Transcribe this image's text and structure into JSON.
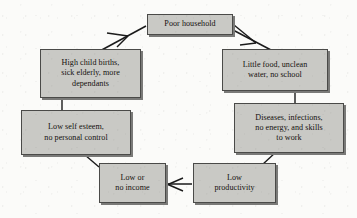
{
  "diagram": {
    "type": "cycle-flowchart",
    "colors": {
      "node_fill": "#c9c9c5",
      "node_border": "#4a4a48",
      "node_shadow": "#7a7a78",
      "background": "#fbfbf9",
      "text": "#14100e",
      "connector": "#1a1a1a"
    },
    "nodes": [
      {
        "id": "poor-household",
        "lines": [
          "Poor household"
        ],
        "x": 147,
        "y": 14,
        "w": 86,
        "h": 21
      },
      {
        "id": "little-food",
        "lines": [
          "Little food, unclean",
          "water, no school"
        ],
        "x": 222,
        "y": 49,
        "w": 106,
        "h": 42
      },
      {
        "id": "diseases",
        "lines": [
          "Diseases, infections,",
          "no energy, and skills",
          "to work"
        ],
        "x": 234,
        "y": 103,
        "w": 110,
        "h": 50
      },
      {
        "id": "low-productivity",
        "lines": [
          "Low",
          "productivity"
        ],
        "x": 193,
        "y": 163,
        "w": 83,
        "h": 40
      },
      {
        "id": "low-income",
        "lines": [
          "Low or",
          "no income"
        ],
        "x": 99,
        "y": 163,
        "w": 67,
        "h": 40
      },
      {
        "id": "low-self-esteem",
        "lines": [
          "Low self esteem,",
          "no personal control"
        ],
        "x": 21,
        "y": 110,
        "w": 110,
        "h": 45
      },
      {
        "id": "high-child-births",
        "lines": [
          "High child births,",
          "sick elderly, more",
          "dependants"
        ],
        "x": 40,
        "y": 49,
        "w": 101,
        "h": 49
      }
    ],
    "connectors": [
      {
        "id": "high-births-to-poor-household",
        "from": "high-child-births",
        "to": "poor-household",
        "arrow": true
      },
      {
        "id": "poor-household-to-little-food",
        "from": "poor-household",
        "to": "little-food",
        "arrow": true
      },
      {
        "id": "little-food-to-diseases",
        "from": "little-food",
        "to": "diseases",
        "arrow": false
      },
      {
        "id": "diseases-to-low-productivity",
        "from": "diseases",
        "to": "low-productivity",
        "arrow": false
      },
      {
        "id": "low-productivity-to-low-income",
        "from": "low-productivity",
        "to": "low-income",
        "arrow": true
      },
      {
        "id": "low-income-to-low-self-esteem",
        "from": "low-income",
        "to": "low-self-esteem",
        "arrow": false
      },
      {
        "id": "low-self-esteem-to-high-births",
        "from": "low-self-esteem",
        "to": "high-child-births",
        "arrow": false
      }
    ]
  }
}
